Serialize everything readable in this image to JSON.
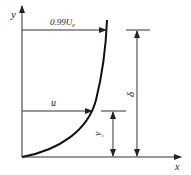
{
  "diagram": {
    "axes": {
      "x_label": "x",
      "y_label": "y"
    },
    "labels": {
      "edge_velocity": "0.99U",
      "edge_velocity_sub": "e",
      "local_velocity": "u",
      "height": "y",
      "thickness": "δ"
    },
    "colors": {
      "stroke": "#222222",
      "background": "#ffffff"
    }
  }
}
